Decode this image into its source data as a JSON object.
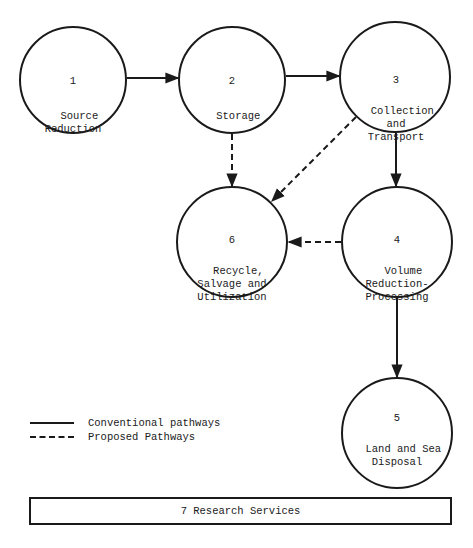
{
  "diagram": {
    "nodes": [
      {
        "id": "1",
        "number": "1",
        "label": "Source\nReduction",
        "cx": 73,
        "cy": 80,
        "r": 53
      },
      {
        "id": "2",
        "number": "2",
        "label": "Storage",
        "cx": 232,
        "cy": 80,
        "r": 53
      },
      {
        "id": "3",
        "number": "3",
        "label": "Collection\nand\nTransport",
        "cx": 395,
        "cy": 77,
        "r": 55
      },
      {
        "id": "4",
        "number": "4",
        "label": "Volume\nReduction-\nProcessing",
        "cx": 397,
        "cy": 242,
        "r": 55
      },
      {
        "id": "5",
        "number": "5",
        "label": "Land and Sea\nDisposal",
        "cx": 397,
        "cy": 433,
        "r": 55
      },
      {
        "id": "6",
        "number": "6",
        "label": "Recycle,\nSalvage and\nUtilization",
        "cx": 232,
        "cy": 242,
        "r": 55
      }
    ],
    "edges": [
      {
        "from": "1",
        "to": "2",
        "type": "conventional"
      },
      {
        "from": "2",
        "to": "3",
        "type": "conventional"
      },
      {
        "from": "3",
        "to": "4",
        "type": "conventional"
      },
      {
        "from": "4",
        "to": "5",
        "type": "conventional"
      },
      {
        "from": "2",
        "to": "6",
        "type": "proposed"
      },
      {
        "from": "3",
        "to": "6",
        "type": "proposed"
      },
      {
        "from": "4",
        "to": "6",
        "type": "proposed"
      }
    ],
    "legend": {
      "conventional": "Conventional pathways",
      "proposed": "Proposed Pathways"
    },
    "research_box": {
      "label": "7 Research Services"
    },
    "colors": {
      "stroke": "#1a1a1a",
      "background": "#ffffff"
    }
  }
}
